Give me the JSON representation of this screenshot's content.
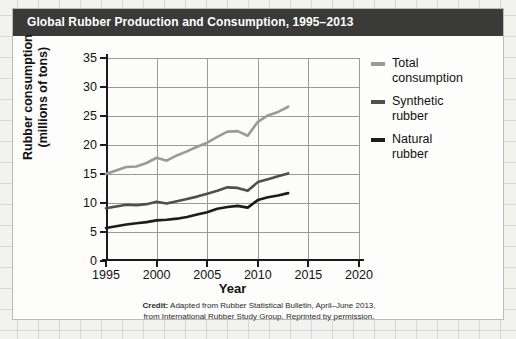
{
  "header": {
    "title": "Global Rubber Production and Consumption, 1995–2013"
  },
  "credit": {
    "label": "Credit:",
    "line1": " Adapted from Rubber Statistical Bulletin, April–June 2013,",
    "line2": "from International Rubber Study Group. Reprinted by permission."
  },
  "legend": {
    "position": "right",
    "items": [
      {
        "label_line1": "Total",
        "label_line2": "consumption",
        "color": "#9a9a9a",
        "name": "total-consumption"
      },
      {
        "label_line1": "Synthetic",
        "label_line2": "rubber",
        "color": "#4f4f4f",
        "name": "synthetic-rubber"
      },
      {
        "label_line1": "Natural",
        "label_line2": "rubber",
        "color": "#1c1c1c",
        "name": "natural-rubber"
      }
    ]
  },
  "chart_data": {
    "type": "line",
    "title": "Global Rubber Production and Consumption, 1995–2013",
    "xlabel": "Year",
    "ylabel": "Rubber consumption (millions of tons)",
    "ylabel_line1": "Rubber consumption",
    "ylabel_line2": "(millions of tons)",
    "xlim": [
      1995,
      2020
    ],
    "ylim": [
      0,
      35
    ],
    "xticks": [
      1995,
      2000,
      2005,
      2010,
      2015,
      2020
    ],
    "yticks": [
      0,
      5,
      10,
      15,
      20,
      25,
      30,
      35
    ],
    "grid": true,
    "x": [
      1995,
      1996,
      1997,
      1998,
      1999,
      2000,
      2001,
      2002,
      2003,
      2004,
      2005,
      2006,
      2007,
      2008,
      2009,
      2010,
      2011,
      2012,
      2013
    ],
    "series": [
      {
        "name": "Total consumption",
        "color": "#9a9a9a",
        "values": [
          15.0,
          15.6,
          16.2,
          16.3,
          16.9,
          17.8,
          17.3,
          18.2,
          18.9,
          19.7,
          20.4,
          21.4,
          22.3,
          22.4,
          21.6,
          24.0,
          25.1,
          25.7,
          26.6
        ]
      },
      {
        "name": "Synthetic rubber",
        "color": "#4f4f4f",
        "values": [
          9.1,
          9.4,
          9.7,
          9.6,
          9.8,
          10.2,
          9.9,
          10.3,
          10.7,
          11.1,
          11.6,
          12.1,
          12.7,
          12.6,
          12.1,
          13.6,
          14.1,
          14.6,
          15.1
        ]
      },
      {
        "name": "Natural rubber",
        "color": "#1c1c1c",
        "values": [
          5.7,
          6.0,
          6.3,
          6.5,
          6.7,
          7.0,
          7.1,
          7.3,
          7.6,
          8.0,
          8.4,
          9.0,
          9.3,
          9.5,
          9.2,
          10.5,
          11.0,
          11.3,
          11.7
        ]
      }
    ]
  }
}
